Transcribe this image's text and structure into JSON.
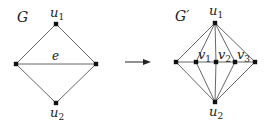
{
  "left_graph": {
    "name": "G",
    "nodes": [
      {
        "id": "u1",
        "label": "u",
        "sub": "1",
        "x": 56,
        "y": 24
      },
      {
        "id": "a",
        "label": "",
        "x": 16,
        "y": 64
      },
      {
        "id": "b",
        "label": "",
        "x": 96,
        "y": 64
      },
      {
        "id": "u2",
        "label": "u",
        "sub": "2",
        "x": 56,
        "y": 103
      }
    ],
    "edge_label": "e",
    "edges": [
      [
        "u1",
        "a"
      ],
      [
        "u1",
        "b"
      ],
      [
        "a",
        "b"
      ],
      [
        "a",
        "u2"
      ],
      [
        "b",
        "u2"
      ]
    ]
  },
  "arrow": {
    "from_x": 125,
    "to_x": 150,
    "y": 62
  },
  "right_graph": {
    "name": "G′",
    "nodes": [
      {
        "id": "u1",
        "label": "u",
        "sub": "1",
        "x": 215,
        "y": 23
      },
      {
        "id": "a",
        "label": "",
        "x": 176,
        "y": 62
      },
      {
        "id": "v1",
        "label": "v",
        "sub": "1",
        "x": 196,
        "y": 62
      },
      {
        "id": "v2",
        "label": "v",
        "sub": "2",
        "x": 216,
        "y": 62
      },
      {
        "id": "v3",
        "label": "v",
        "sub": "3",
        "x": 235,
        "y": 62
      },
      {
        "id": "b",
        "label": "",
        "x": 255,
        "y": 62
      },
      {
        "id": "u2",
        "label": "u",
        "sub": "2",
        "x": 215,
        "y": 102
      }
    ],
    "edges": [
      [
        "u1",
        "a"
      ],
      [
        "u1",
        "v1"
      ],
      [
        "u1",
        "v2"
      ],
      [
        "u1",
        "v3"
      ],
      [
        "u1",
        "b"
      ],
      [
        "u2",
        "a"
      ],
      [
        "u2",
        "v1"
      ],
      [
        "u2",
        "v2"
      ],
      [
        "u2",
        "v3"
      ],
      [
        "u2",
        "b"
      ],
      [
        "a",
        "b"
      ]
    ]
  }
}
